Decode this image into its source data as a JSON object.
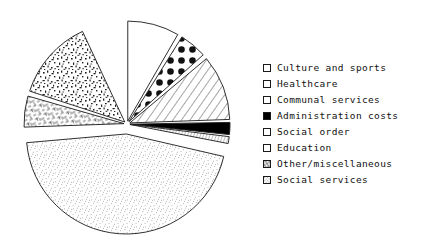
{
  "chart_data": {
    "type": "pie",
    "title": "",
    "subtitle": "",
    "xlabel": "",
    "ylabel": "",
    "grid": false,
    "legend_position": "right",
    "exploded": true,
    "start_angle_deg": 0,
    "direction": "clockwise",
    "center": {
      "x": 127,
      "y": 124
    },
    "radius": 100,
    "categories": [
      "Culture and sports",
      "Healthcare",
      "Communal services",
      "Administration costs",
      "Social order",
      "Education",
      "Other/miscellaneous",
      "Social services"
    ],
    "values": [
      8.3,
      4.4,
      10.6,
      2.0,
      1.1,
      13.1,
      5.0,
      55.5
    ],
    "units": "percent",
    "slices": [
      {
        "label": "Culture and sports",
        "value": 8.3,
        "start_deg": 0.0,
        "end_deg": 30.0,
        "fill": "plain",
        "swatch": "plain",
        "explode": 3
      },
      {
        "label": "Healthcare",
        "value": 4.4,
        "start_deg": 32.0,
        "end_deg": 48.0,
        "fill": "big-dots",
        "swatch": "plain",
        "explode": 3
      },
      {
        "label": "Communal services",
        "value": 10.6,
        "start_deg": 50.0,
        "end_deg": 88.0,
        "fill": "diagonal",
        "swatch": "plain",
        "explode": 3
      },
      {
        "label": "Administration costs",
        "value": 2.0,
        "start_deg": 89.0,
        "end_deg": 96.0,
        "fill": "solid-black",
        "swatch": "solid-black",
        "explode": 3
      },
      {
        "label": "Social order",
        "value": 1.1,
        "start_deg": 97.0,
        "end_deg": 101.0,
        "fill": "fine-hatch",
        "swatch": "plain",
        "explode": 3
      },
      {
        "label": "Social services",
        "value": 55.5,
        "start_deg": 103.0,
        "end_deg": 265.0,
        "fill": "stipple",
        "swatch": "stipple",
        "explode": 10
      },
      {
        "label": "Other/miscellaneous",
        "value": 5.0,
        "start_deg": 268.0,
        "end_deg": 286.0,
        "fill": "dash-hatch",
        "swatch": "dash-hatch",
        "explode": 3
      },
      {
        "label": "Education",
        "value": 13.1,
        "start_deg": 288.0,
        "end_deg": 335.0,
        "fill": "speckle",
        "swatch": "plain",
        "explode": 3
      }
    ],
    "colors": {
      "outline": "#1a1a1a",
      "fill_white": "#ffffff",
      "fill_black": "#000000",
      "background": "#ffffff"
    }
  },
  "legend": {
    "items": [
      {
        "label": "Culture and sports",
        "swatch": "plain"
      },
      {
        "label": "Healthcare",
        "swatch": "plain"
      },
      {
        "label": "Communal services",
        "swatch": "plain"
      },
      {
        "label": "Administration costs",
        "swatch": "solid-black"
      },
      {
        "label": "Social order",
        "swatch": "plain"
      },
      {
        "label": "Education",
        "swatch": "plain"
      },
      {
        "label": "Other/miscellaneous",
        "swatch": "dash-hatch"
      },
      {
        "label": "Social services",
        "swatch": "stipple"
      }
    ]
  }
}
